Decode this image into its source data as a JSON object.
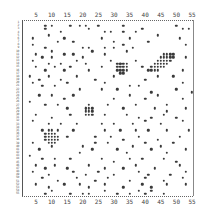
{
  "chart_data": {
    "type": "scatter",
    "title": "",
    "xlabel": "",
    "ylabel": "",
    "grid": false,
    "x_ticks": [
      "5",
      "10",
      "15",
      "20",
      "25",
      "30",
      "35",
      "40",
      "45",
      "50",
      "55"
    ],
    "xlim": [
      1,
      55
    ],
    "ylim": [
      1,
      55
    ],
    "row_count": 55,
    "clusters": [
      {
        "name": "cluster-upper-right-diagonal",
        "center": [
          44,
          11
        ],
        "approx_cells": 28
      },
      {
        "name": "cluster-upper-middle",
        "center": [
          32,
          16
        ],
        "approx_cells": 16
      },
      {
        "name": "cluster-center",
        "center": [
          22,
          29
        ],
        "approx_cells": 12
      },
      {
        "name": "cluster-lower-left",
        "center": [
          10,
          37
        ],
        "approx_cells": 20
      }
    ],
    "points": [
      [
        8,
        2
      ],
      [
        10,
        2
      ],
      [
        16,
        2
      ],
      [
        19,
        2
      ],
      [
        21,
        2
      ],
      [
        25,
        2
      ],
      [
        33,
        2
      ],
      [
        50,
        2
      ],
      [
        52,
        3
      ],
      [
        54,
        3
      ],
      [
        8,
        3
      ],
      [
        13,
        4
      ],
      [
        22,
        3
      ],
      [
        27,
        4
      ],
      [
        29,
        4
      ],
      [
        33,
        4
      ],
      [
        37,
        4
      ],
      [
        39,
        3
      ],
      [
        44,
        5
      ],
      [
        4,
        6
      ],
      [
        9,
        5
      ],
      [
        12,
        7
      ],
      [
        14,
        6
      ],
      [
        17,
        7
      ],
      [
        26,
        6
      ],
      [
        30,
        7
      ],
      [
        35,
        6
      ],
      [
        41,
        7
      ],
      [
        51,
        6
      ],
      [
        53,
        8
      ],
      [
        4,
        8
      ],
      [
        8,
        9
      ],
      [
        10,
        10
      ],
      [
        20,
        9
      ],
      [
        22,
        9
      ],
      [
        27,
        9
      ],
      [
        30,
        9
      ],
      [
        33,
        8
      ],
      [
        36,
        9
      ],
      [
        5,
        11
      ],
      [
        7,
        12
      ],
      [
        10,
        12
      ],
      [
        14,
        11
      ],
      [
        17,
        11
      ],
      [
        20,
        12
      ],
      [
        23,
        10
      ],
      [
        27,
        11
      ],
      [
        34,
        10
      ],
      [
        53,
        12
      ],
      [
        4,
        13
      ],
      [
        9,
        14
      ],
      [
        13,
        14
      ],
      [
        18,
        13
      ],
      [
        21,
        14
      ],
      [
        29,
        13
      ],
      [
        32,
        14
      ],
      [
        37,
        13
      ],
      [
        5,
        15
      ],
      [
        8,
        16
      ],
      [
        11,
        15
      ],
      [
        14,
        16
      ],
      [
        16,
        15
      ],
      [
        22,
        16
      ],
      [
        26,
        15
      ],
      [
        39,
        15
      ],
      [
        49,
        18
      ],
      [
        52,
        16
      ],
      [
        3,
        18
      ],
      [
        6,
        19
      ],
      [
        9,
        18
      ],
      [
        13,
        19
      ],
      [
        18,
        18
      ],
      [
        24,
        19
      ],
      [
        27,
        20
      ],
      [
        30,
        18
      ],
      [
        35,
        21
      ],
      [
        40,
        19
      ],
      [
        44,
        18
      ],
      [
        52,
        20
      ],
      [
        4,
        20
      ],
      [
        7,
        21
      ],
      [
        11,
        21
      ],
      [
        15,
        20
      ],
      [
        19,
        22
      ],
      [
        26,
        22
      ],
      [
        31,
        22
      ],
      [
        38,
        21
      ],
      [
        42,
        23
      ],
      [
        50,
        22
      ],
      [
        55,
        23
      ],
      [
        6,
        24
      ],
      [
        10,
        24
      ],
      [
        14,
        25
      ],
      [
        17,
        24
      ],
      [
        30,
        25
      ],
      [
        35,
        24
      ],
      [
        40,
        25
      ],
      [
        44,
        24
      ],
      [
        47,
        27
      ],
      [
        52,
        25
      ],
      [
        3,
        26
      ],
      [
        8,
        27
      ],
      [
        12,
        27
      ],
      [
        15,
        28
      ],
      [
        21,
        28
      ],
      [
        28,
        27
      ],
      [
        33,
        28
      ],
      [
        37,
        27
      ],
      [
        43,
        28
      ],
      [
        47,
        29
      ],
      [
        53,
        28
      ],
      [
        5,
        30
      ],
      [
        10,
        31
      ],
      [
        16,
        30
      ],
      [
        27,
        30
      ],
      [
        34,
        30
      ],
      [
        38,
        31
      ],
      [
        42,
        31
      ],
      [
        46,
        30
      ],
      [
        50,
        31
      ],
      [
        4,
        32
      ],
      [
        9,
        33
      ],
      [
        13,
        33
      ],
      [
        18,
        33
      ],
      [
        26,
        33
      ],
      [
        30,
        33
      ],
      [
        36,
        33
      ],
      [
        40,
        32
      ],
      [
        45,
        33
      ],
      [
        52,
        32
      ],
      [
        7,
        35
      ],
      [
        12,
        35
      ],
      [
        17,
        35
      ],
      [
        27,
        35
      ],
      [
        32,
        35
      ],
      [
        37,
        35
      ],
      [
        41,
        35
      ],
      [
        47,
        35
      ],
      [
        54,
        35
      ],
      [
        15,
        37
      ],
      [
        24,
        37
      ],
      [
        29,
        37
      ],
      [
        33,
        38
      ],
      [
        38,
        37
      ],
      [
        44,
        38
      ],
      [
        51,
        37
      ],
      [
        4,
        39
      ],
      [
        20,
        40
      ],
      [
        24,
        39
      ],
      [
        28,
        39
      ],
      [
        36,
        40
      ],
      [
        40,
        39
      ],
      [
        45,
        40
      ],
      [
        49,
        39
      ],
      [
        6,
        41
      ],
      [
        19,
        42
      ],
      [
        23,
        41
      ],
      [
        31,
        41
      ],
      [
        34,
        42
      ],
      [
        42,
        41
      ],
      [
        47,
        42
      ],
      [
        53,
        41
      ],
      [
        3,
        43
      ],
      [
        7,
        44
      ],
      [
        11,
        44
      ],
      [
        16,
        44
      ],
      [
        26,
        44
      ],
      [
        30,
        45
      ],
      [
        35,
        44
      ],
      [
        39,
        44
      ],
      [
        46,
        44
      ],
      [
        50,
        45
      ],
      [
        5,
        46
      ],
      [
        8,
        47
      ],
      [
        11,
        46
      ],
      [
        15,
        47
      ],
      [
        22,
        46
      ],
      [
        27,
        47
      ],
      [
        33,
        47
      ],
      [
        37,
        46
      ],
      [
        43,
        47
      ],
      [
        51,
        46
      ],
      [
        4,
        48
      ],
      [
        9,
        49
      ],
      [
        17,
        48
      ],
      [
        21,
        49
      ],
      [
        25,
        48
      ],
      [
        30,
        49
      ],
      [
        38,
        48
      ],
      [
        41,
        49
      ],
      [
        48,
        49
      ],
      [
        53,
        48
      ],
      [
        7,
        50
      ],
      [
        12,
        51
      ],
      [
        18,
        50
      ],
      [
        24,
        51
      ],
      [
        28,
        50
      ],
      [
        35,
        51
      ],
      [
        40,
        50
      ],
      [
        46,
        51
      ],
      [
        52,
        50
      ],
      [
        5,
        52
      ],
      [
        9,
        53
      ],
      [
        14,
        52
      ],
      [
        19,
        52
      ],
      [
        22,
        53
      ],
      [
        27,
        52
      ],
      [
        33,
        53
      ],
      [
        39,
        52
      ],
      [
        42,
        53
      ],
      [
        47,
        52
      ],
      [
        53,
        52
      ],
      [
        8,
        55
      ],
      [
        10,
        54
      ],
      [
        16,
        55
      ],
      [
        20,
        55
      ],
      [
        22,
        55
      ],
      [
        27,
        54
      ],
      [
        31,
        55
      ],
      [
        35,
        55
      ],
      [
        38,
        54
      ],
      [
        40,
        55
      ],
      [
        42,
        54
      ],
      [
        46,
        55
      ]
    ]
  },
  "axes": {
    "top_ticks": [
      "5",
      "10",
      "15",
      "20",
      "25",
      "30",
      "35",
      "40",
      "45",
      "50",
      "55"
    ],
    "bottom_ticks": [
      "5",
      "10",
      "15",
      "20",
      "25",
      "30",
      "35",
      "40",
      "45",
      "50",
      "55"
    ]
  }
}
